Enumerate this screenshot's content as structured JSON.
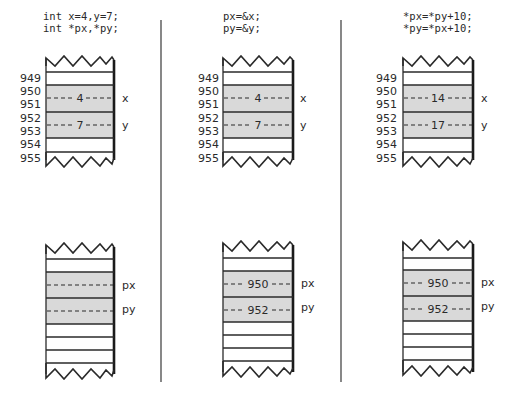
{
  "colors": {
    "ink": "#2a2a2a",
    "shade": "#d9d9d9",
    "background": "#ffffff",
    "divider": "#555555"
  },
  "panels": [
    {
      "code": [
        "int x=4,y=7;",
        "int *px,*py;"
      ],
      "variables_memory": {
        "addresses": [
          "949",
          "950",
          "951",
          "952",
          "953",
          "954",
          "955"
        ],
        "cells": [
          {
            "name": "x",
            "value": "4"
          },
          {
            "name": "y",
            "value": "7"
          }
        ]
      },
      "pointers_memory": {
        "cells": [
          {
            "name": "px",
            "value": ""
          },
          {
            "name": "py",
            "value": ""
          }
        ]
      }
    },
    {
      "code": [
        "px=&x;",
        "py=&y;"
      ],
      "variables_memory": {
        "addresses": [
          "949",
          "950",
          "951",
          "952",
          "953",
          "954",
          "955"
        ],
        "cells": [
          {
            "name": "x",
            "value": "4"
          },
          {
            "name": "y",
            "value": "7"
          }
        ]
      },
      "pointers_memory": {
        "cells": [
          {
            "name": "px",
            "value": "950"
          },
          {
            "name": "py",
            "value": "952"
          }
        ]
      }
    },
    {
      "code": [
        "*px=*py+10;",
        "*py=*px+10;"
      ],
      "variables_memory": {
        "addresses": [
          "949",
          "950",
          "951",
          "952",
          "953",
          "954",
          "955"
        ],
        "cells": [
          {
            "name": "x",
            "value": "14"
          },
          {
            "name": "y",
            "value": "17"
          }
        ]
      },
      "pointers_memory": {
        "cells": [
          {
            "name": "px",
            "value": "950"
          },
          {
            "name": "py",
            "value": "952"
          }
        ]
      }
    }
  ]
}
